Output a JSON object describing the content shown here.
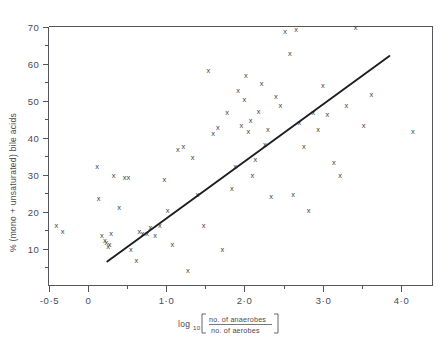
{
  "figure": {
    "name": "scatter-plot-bile-acids",
    "background_color": "#ffffff",
    "axis_color": "#55555c",
    "marker_color": "#3c3c42",
    "line_color": "#1d1d22"
  },
  "axes": {
    "x": {
      "label_main": "log",
      "label_sub": "10",
      "numerator": "no. of anaerobes",
      "denominator": "no. of aerobes",
      "min": -0.5,
      "max": 4.4,
      "major_ticks": [
        -0.5,
        0,
        1.0,
        2.0,
        3.0,
        4.0
      ],
      "major_tick_labels": [
        "-0·5",
        "0",
        "1·0",
        "2·0",
        "3·0",
        "4·0"
      ],
      "minor_ticks": [
        0.5,
        1.5,
        2.5,
        3.5
      ]
    },
    "y": {
      "label": "% (mono + unsaturated) bile acids",
      "min": 0,
      "max": 70,
      "major_ticks": [
        10,
        20,
        30,
        40,
        50,
        60,
        70
      ],
      "major_tick_labels": [
        "10",
        "20",
        "30",
        "40",
        "50",
        "60",
        "70"
      ],
      "minor_ticks": [
        5,
        15,
        25,
        35,
        45,
        55,
        65
      ]
    }
  },
  "chart_data": {
    "type": "scatter",
    "title": "",
    "xlabel": "log10 [no. of anaerobes / no. of aerobes]",
    "ylabel": "% (mono + unsaturated) bile acids",
    "xlim": [
      -0.5,
      4.4
    ],
    "ylim": [
      0,
      70
    ],
    "grid": false,
    "legend": "none",
    "marker_symbol": "x",
    "x": [
      -0.4,
      -0.32,
      0.12,
      0.14,
      0.18,
      0.22,
      0.24,
      0.26,
      0.28,
      0.3,
      0.33,
      0.4,
      0.47,
      0.52,
      0.55,
      0.62,
      0.66,
      0.7,
      0.76,
      0.8,
      0.86,
      0.92,
      0.98,
      1.02,
      1.08,
      1.15,
      1.22,
      1.28,
      1.34,
      1.4,
      1.48,
      1.54,
      1.6,
      1.66,
      1.72,
      1.78,
      1.84,
      1.88,
      1.92,
      1.96,
      2.0,
      2.02,
      2.05,
      2.08,
      2.1,
      2.14,
      2.18,
      2.22,
      2.26,
      2.3,
      2.34,
      2.4,
      2.46,
      2.52,
      2.58,
      2.62,
      2.66,
      2.7,
      2.76,
      2.82,
      2.88,
      2.94,
      3.0,
      3.06,
      3.14,
      3.22,
      3.3,
      3.42,
      3.52,
      3.62,
      4.15
    ],
    "y": [
      16.0,
      14.5,
      32.0,
      23.5,
      13.5,
      12.0,
      11.5,
      10.5,
      11.0,
      14.0,
      29.5,
      21.0,
      29.0,
      29.0,
      9.5,
      6.5,
      14.5,
      14.0,
      14.0,
      15.5,
      13.5,
      16.0,
      28.5,
      20.0,
      11.0,
      36.5,
      37.5,
      4.0,
      34.5,
      24.5,
      16.0,
      58.0,
      41.0,
      42.5,
      9.5,
      46.5,
      26.0,
      32.0,
      52.5,
      43.0,
      50.0,
      56.5,
      41.5,
      44.5,
      29.5,
      34.0,
      47.0,
      54.5,
      38.0,
      42.0,
      24.0,
      51.0,
      48.5,
      68.5,
      62.5,
      24.5,
      69.0,
      44.0,
      37.5,
      20.0,
      46.5,
      42.0,
      54.0,
      46.0,
      33.0,
      29.5,
      48.5,
      69.5,
      43.0,
      51.5,
      41.5
    ],
    "fit_line": {
      "label": "regression line",
      "x_start": 0.25,
      "y_start": 6.5,
      "x_end": 3.85,
      "y_end": 62.0
    }
  }
}
